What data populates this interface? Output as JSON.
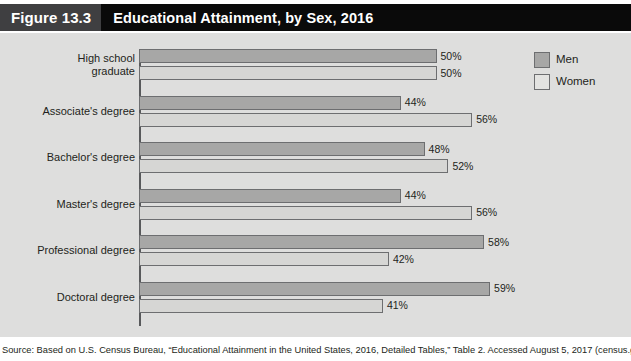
{
  "header": {
    "figure_number": "Figure 13.3",
    "title": "Educational Attainment, by Sex, 2016"
  },
  "legend": {
    "items": [
      {
        "label": "Men",
        "color": "#a7a7a6"
      },
      {
        "label": "Women",
        "color": "#e3e3e1"
      }
    ]
  },
  "source": {
    "text": "Source: Based on U.S. Census Bureau, “Educational Attainment in the United States, 2016, Detailed Tables,” Table 2. Accessed August 5, 2017 (census.gov/hhes"
  },
  "chart_data": {
    "type": "bar",
    "orientation": "horizontal",
    "title": "Educational Attainment, by Sex, 2016",
    "xlabel": "",
    "ylabel": "",
    "xlim": [
      0,
      60
    ],
    "grid": false,
    "legend_position": "top-right",
    "categories": [
      "High school\ngraduate",
      "Associate's degree",
      "Bachelor's degree",
      "Master's degree",
      "Professional degree",
      "Doctoral degree"
    ],
    "series": [
      {
        "name": "Men",
        "values": [
          50,
          44,
          48,
          44,
          58,
          59
        ],
        "color": "#a7a7a6"
      },
      {
        "name": "Women",
        "values": [
          50,
          56,
          52,
          56,
          42,
          41
        ],
        "color": "#d6d6d4"
      }
    ],
    "value_labels": {
      "Men": [
        "50%",
        "44%",
        "48%",
        "44%",
        "58%",
        "59%"
      ],
      "Women": [
        "50%",
        "56%",
        "52%",
        "56%",
        "42%",
        "41%"
      ]
    }
  }
}
